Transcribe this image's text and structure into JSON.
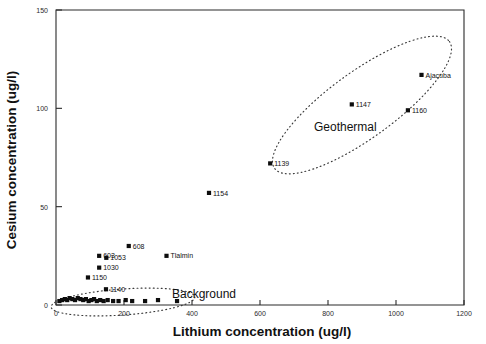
{
  "chart_data": {
    "type": "scatter",
    "title": "",
    "xlabel": "Lithium concentration (ug/l)",
    "ylabel": "Cesium concentration (ug/l)",
    "xlim": [
      0,
      1200
    ],
    "ylim": [
      0,
      150
    ],
    "xticks": [
      0,
      200,
      400,
      600,
      800,
      1000,
      1200
    ],
    "yticks": [
      0,
      50,
      100,
      150
    ],
    "xtick_labels": [
      "0",
      "200",
      "400",
      "600",
      "800",
      "1000",
      "1200"
    ],
    "ytick_labels": [
      "0",
      "50",
      "100",
      "150"
    ],
    "grid": false,
    "legend": false,
    "marker": "filled-square",
    "annotations": [
      {
        "name": "geothermal-group-label",
        "text": "Geothermal",
        "x": 690,
        "y": 83
      },
      {
        "name": "background-group-label",
        "text": "Background",
        "x": 430,
        "y": 8
      }
    ],
    "groups": [
      {
        "name": "Geothermal",
        "outline": "dotted-ellipse",
        "points": [
          {
            "label": "Ajacuba",
            "x": 1075,
            "y": 117
          },
          {
            "label": "1147",
            "x": 870,
            "y": 102
          },
          {
            "label": "1160",
            "x": 1035,
            "y": 99
          },
          {
            "label": "1139",
            "x": 630,
            "y": 72
          }
        ]
      },
      {
        "name": "Mid",
        "outline": "none",
        "points": [
          {
            "label": "1154",
            "x": 450,
            "y": 57
          },
          {
            "label": "Tlalmin",
            "x": 325,
            "y": 25
          }
        ]
      },
      {
        "name": "Background",
        "outline": "dotted-ellipse",
        "points": [
          {
            "label": "608",
            "x": 214,
            "y": 30
          },
          {
            "label": "603",
            "x": 127,
            "y": 25
          },
          {
            "label": "1053",
            "x": 148,
            "y": 24
          },
          {
            "label": "1030",
            "x": 127,
            "y": 19
          },
          {
            "label": "1150",
            "x": 94,
            "y": 14
          },
          {
            "label": "1140",
            "x": 147,
            "y": 8
          },
          {
            "label": "",
            "x": 10,
            "y": 2
          },
          {
            "label": "",
            "x": 18,
            "y": 2.5
          },
          {
            "label": "",
            "x": 26,
            "y": 3
          },
          {
            "label": "",
            "x": 33,
            "y": 2.5
          },
          {
            "label": "",
            "x": 40,
            "y": 3.5
          },
          {
            "label": "",
            "x": 48,
            "y": 3
          },
          {
            "label": "",
            "x": 56,
            "y": 2.5
          },
          {
            "label": "",
            "x": 64,
            "y": 3.5
          },
          {
            "label": "",
            "x": 72,
            "y": 3
          },
          {
            "label": "",
            "x": 80,
            "y": 2.5
          },
          {
            "label": "",
            "x": 88,
            "y": 3
          },
          {
            "label": "",
            "x": 96,
            "y": 2
          },
          {
            "label": "",
            "x": 104,
            "y": 2.5
          },
          {
            "label": "",
            "x": 112,
            "y": 3
          },
          {
            "label": "",
            "x": 120,
            "y": 2
          },
          {
            "label": "",
            "x": 130,
            "y": 2.5
          },
          {
            "label": "",
            "x": 140,
            "y": 2
          },
          {
            "label": "",
            "x": 152,
            "y": 2.5
          },
          {
            "label": "",
            "x": 168,
            "y": 2
          },
          {
            "label": "",
            "x": 184,
            "y": 2
          },
          {
            "label": "",
            "x": 205,
            "y": 2.5
          },
          {
            "label": "",
            "x": 224,
            "y": 2
          },
          {
            "label": "",
            "x": 262,
            "y": 2
          },
          {
            "label": "",
            "x": 300,
            "y": 2.5
          },
          {
            "label": "",
            "x": 356,
            "y": 2
          }
        ]
      }
    ]
  }
}
